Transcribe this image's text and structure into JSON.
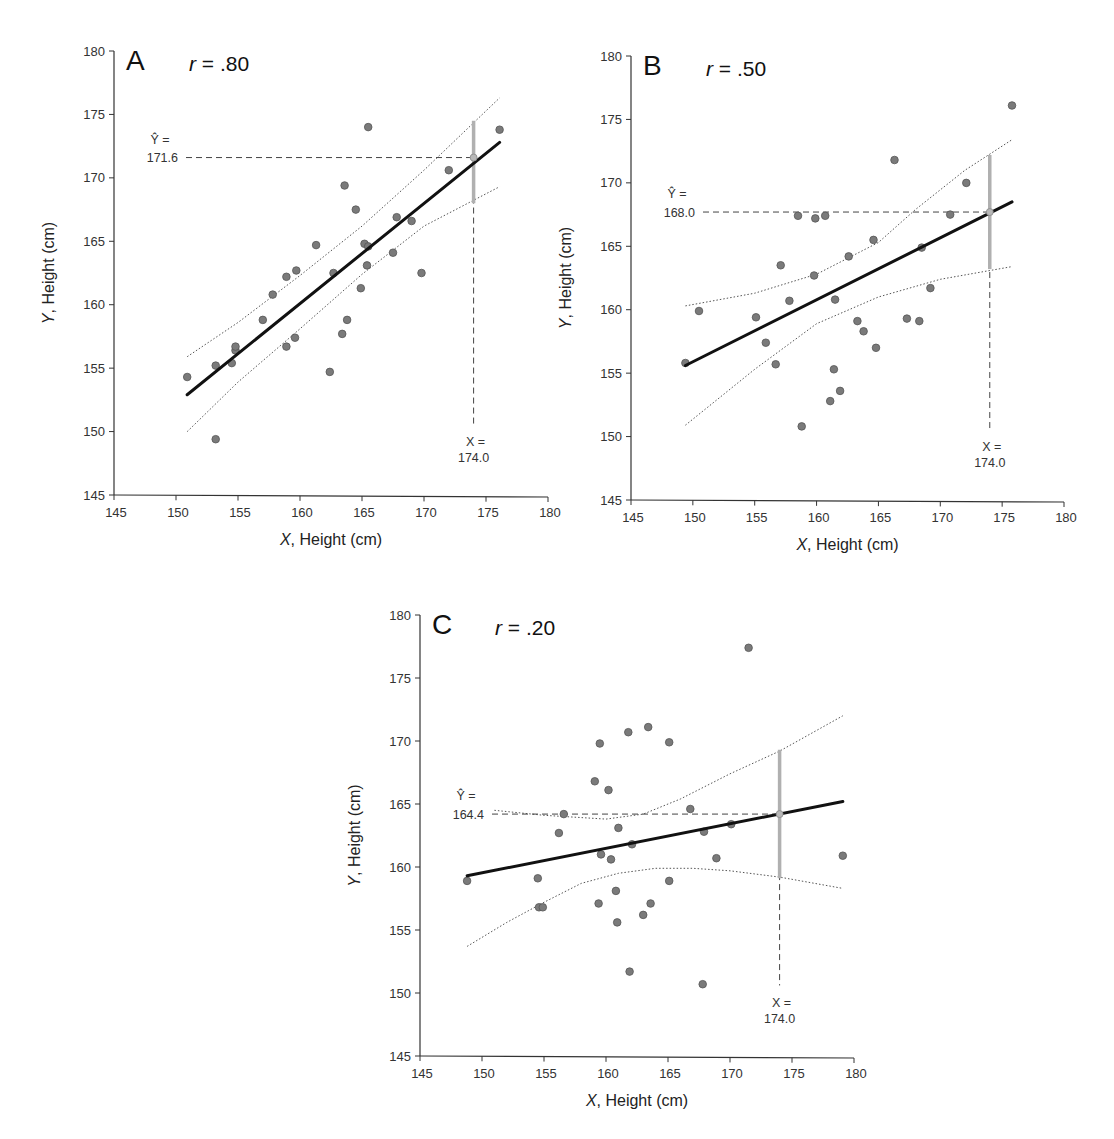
{
  "figure": {
    "width": 1114,
    "height": 1139,
    "colors": {
      "point_fill": "#7a7a7a",
      "point_stroke": "#555555",
      "regression_line": "#111111",
      "confidence_band": "#555555",
      "prediction_bar": "#b0b0b0",
      "predicted_marker": "#b8b8b8",
      "axis": "#333333",
      "guide_dash": "#444444"
    }
  },
  "chart_data": [
    {
      "type": "scatter",
      "panel": "A",
      "title": "r = .80",
      "r_italic": "r",
      "r_value": " = .80",
      "xlabel_italic": "X",
      "xlabel_rest": ", Height (cm)",
      "ylabel_italic": "Y",
      "ylabel_rest": ", Height (cm)",
      "xlim": [
        145,
        180
      ],
      "ylim": [
        145,
        180
      ],
      "xticks": [
        145,
        150,
        155,
        160,
        165,
        170,
        175,
        180
      ],
      "yticks": [
        145,
        150,
        155,
        160,
        165,
        170,
        175,
        180
      ],
      "grid": false,
      "layout": {
        "x0": 114,
        "x1": 548,
        "y0": 495,
        "y1": 51
      },
      "regression": {
        "x_start": 150.9,
        "y_start": 152.9,
        "x_end": 176.1,
        "y_end": 172.8
      },
      "confidence_upper": [
        [
          150.9,
          155.9
        ],
        [
          155,
          158.6
        ],
        [
          160,
          162.3
        ],
        [
          165,
          166.2
        ],
        [
          170,
          170.6
        ],
        [
          176.1,
          176.3
        ]
      ],
      "confidence_lower": [
        [
          150.9,
          150.0
        ],
        [
          155,
          153.9
        ],
        [
          160,
          158.1
        ],
        [
          165,
          162.4
        ],
        [
          170,
          166.2
        ],
        [
          176.1,
          169.3
        ]
      ],
      "prediction": {
        "x": 174.0,
        "y_hat": 171.6,
        "y_hat_label_sym": "Ŷ =",
        "y_hat_label_val": "171.6",
        "x_label_sym": "X =",
        "x_label_val": "174.0",
        "bar_low": 168.0,
        "bar_high": 174.5
      },
      "points": [
        [
          150.9,
          154.3
        ],
        [
          153.2,
          155.2
        ],
        [
          153.2,
          149.4
        ],
        [
          154.5,
          155.4
        ],
        [
          154.8,
          156.4
        ],
        [
          154.8,
          156.7
        ],
        [
          157.0,
          158.8
        ],
        [
          157.8,
          160.8
        ],
        [
          158.9,
          162.2
        ],
        [
          158.9,
          156.7
        ],
        [
          159.6,
          157.4
        ],
        [
          159.7,
          162.7
        ],
        [
          161.3,
          164.7
        ],
        [
          162.4,
          154.7
        ],
        [
          162.7,
          162.5
        ],
        [
          163.4,
          157.7
        ],
        [
          163.6,
          169.4
        ],
        [
          163.8,
          158.8
        ],
        [
          164.5,
          167.5
        ],
        [
          164.9,
          161.3
        ],
        [
          165.2,
          164.8
        ],
        [
          165.4,
          163.1
        ],
        [
          165.5,
          164.6
        ],
        [
          165.5,
          174.0
        ],
        [
          167.5,
          164.1
        ],
        [
          167.8,
          166.9
        ],
        [
          169.0,
          166.6
        ],
        [
          169.8,
          162.5
        ],
        [
          172.0,
          170.6
        ],
        [
          176.1,
          173.8
        ]
      ]
    },
    {
      "type": "scatter",
      "panel": "B",
      "title": "r = .50",
      "r_italic": "r",
      "r_value": " = .50",
      "xlabel_italic": "X",
      "xlabel_rest": ", Height (cm)",
      "ylabel_italic": "Y",
      "ylabel_rest": ", Height (cm)",
      "xlim": [
        145,
        180
      ],
      "ylim": [
        145,
        180
      ],
      "xticks": [
        145,
        150,
        155,
        160,
        165,
        170,
        175,
        180
      ],
      "yticks": [
        145,
        150,
        155,
        160,
        165,
        170,
        175,
        180
      ],
      "grid": false,
      "layout": {
        "x0": 631,
        "x1": 1064,
        "y0": 500,
        "y1": 56
      },
      "regression": {
        "x_start": 149.4,
        "y_start": 155.6,
        "x_end": 175.8,
        "y_end": 168.5
      },
      "confidence_upper": [
        [
          149.4,
          160.3
        ],
        [
          155,
          161.3
        ],
        [
          160,
          162.8
        ],
        [
          165,
          165.3
        ],
        [
          168,
          167.9
        ],
        [
          172,
          171.0
        ],
        [
          175.8,
          173.4
        ]
      ],
      "confidence_lower": [
        [
          149.4,
          150.9
        ],
        [
          155,
          155.3
        ],
        [
          160,
          158.9
        ],
        [
          165,
          161.0
        ],
        [
          170,
          162.4
        ],
        [
          175.8,
          163.4
        ]
      ],
      "prediction": {
        "x": 174.0,
        "y_hat": 167.7,
        "y_hat_label_sym": "Ŷ =",
        "y_hat_label_val": "168.0",
        "x_label_sym": "X =",
        "x_label_val": "174.0",
        "bar_low": 163.2,
        "bar_high": 172.2
      },
      "points": [
        [
          149.4,
          155.8
        ],
        [
          150.5,
          159.9
        ],
        [
          155.1,
          159.4
        ],
        [
          155.9,
          157.4
        ],
        [
          156.7,
          155.7
        ],
        [
          157.1,
          163.5
        ],
        [
          157.8,
          160.7
        ],
        [
          158.5,
          167.4
        ],
        [
          158.8,
          150.8
        ],
        [
          159.8,
          162.7
        ],
        [
          159.9,
          167.2
        ],
        [
          160.7,
          167.4
        ],
        [
          161.1,
          152.8
        ],
        [
          161.4,
          155.3
        ],
        [
          161.5,
          160.8
        ],
        [
          161.9,
          153.6
        ],
        [
          162.6,
          164.2
        ],
        [
          163.3,
          159.1
        ],
        [
          163.8,
          158.3
        ],
        [
          164.6,
          165.5
        ],
        [
          164.8,
          157.0
        ],
        [
          166.3,
          171.8
        ],
        [
          167.3,
          159.3
        ],
        [
          168.3,
          159.1
        ],
        [
          168.5,
          164.9
        ],
        [
          169.2,
          161.7
        ],
        [
          170.8,
          167.5
        ],
        [
          172.1,
          170.0
        ],
        [
          175.8,
          176.1
        ]
      ]
    },
    {
      "type": "scatter",
      "panel": "C",
      "title": "r = .20",
      "r_italic": "r",
      "r_value": " = .20",
      "xlabel_italic": "X",
      "xlabel_rest": ", Height (cm)",
      "ylabel_italic": "Y",
      "ylabel_rest": ", Height (cm)",
      "xlim": [
        145,
        180
      ],
      "ylim": [
        145,
        180
      ],
      "xticks": [
        145,
        150,
        155,
        160,
        165,
        170,
        175,
        180
      ],
      "yticks": [
        145,
        150,
        155,
        160,
        165,
        170,
        175,
        180
      ],
      "grid": false,
      "layout": {
        "x0": 420,
        "x1": 854,
        "y0": 1056,
        "y1": 615
      },
      "regression": {
        "x_start": 148.8,
        "y_start": 159.3,
        "x_end": 179.1,
        "y_end": 165.2
      },
      "confidence_upper": [
        [
          151,
          164.5
        ],
        [
          155,
          164.1
        ],
        [
          160,
          163.8
        ],
        [
          163,
          164.2
        ],
        [
          166,
          165.4
        ],
        [
          170,
          167.4
        ],
        [
          174,
          169.2
        ],
        [
          179.1,
          172.0
        ]
      ],
      "confidence_lower": [
        [
          148.8,
          153.7
        ],
        [
          152,
          155.6
        ],
        [
          155,
          157.2
        ],
        [
          158,
          158.7
        ],
        [
          161,
          159.5
        ],
        [
          164,
          159.9
        ],
        [
          167,
          159.9
        ],
        [
          170,
          159.7
        ],
        [
          174,
          159.2
        ],
        [
          179.1,
          158.3
        ]
      ],
      "prediction": {
        "x": 174.0,
        "y_hat": 164.2,
        "y_hat_label_sym": "Ŷ =",
        "y_hat_label_val": "164.4",
        "x_label_sym": "X =",
        "x_label_val": "174.0",
        "bar_low": 159.1,
        "bar_high": 169.3
      },
      "points": [
        [
          148.8,
          158.9
        ],
        [
          154.5,
          159.1
        ],
        [
          154.6,
          156.8
        ],
        [
          154.9,
          156.8
        ],
        [
          156.2,
          162.7
        ],
        [
          156.6,
          164.2
        ],
        [
          159.1,
          166.8
        ],
        [
          159.4,
          157.1
        ],
        [
          159.5,
          169.8
        ],
        [
          159.6,
          161.0
        ],
        [
          160.2,
          166.1
        ],
        [
          160.4,
          160.6
        ],
        [
          160.8,
          158.1
        ],
        [
          160.9,
          155.6
        ],
        [
          161.0,
          163.1
        ],
        [
          161.8,
          170.7
        ],
        [
          161.9,
          151.7
        ],
        [
          162.1,
          161.8
        ],
        [
          163.0,
          156.2
        ],
        [
          163.4,
          171.1
        ],
        [
          163.6,
          157.1
        ],
        [
          165.1,
          169.9
        ],
        [
          165.1,
          158.9
        ],
        [
          166.8,
          164.6
        ],
        [
          167.8,
          150.7
        ],
        [
          167.9,
          162.8
        ],
        [
          168.9,
          160.7
        ],
        [
          170.1,
          163.4
        ],
        [
          171.5,
          177.4
        ],
        [
          179.1,
          160.9
        ]
      ]
    }
  ]
}
